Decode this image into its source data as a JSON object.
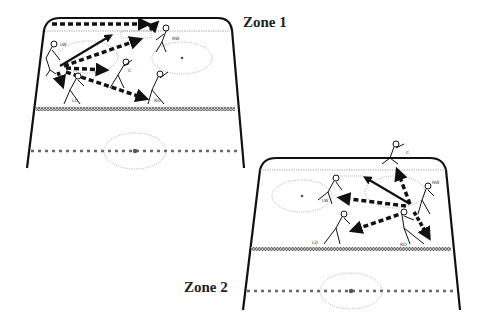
{
  "zones": [
    {
      "id": "zone1",
      "label": "Zone 1",
      "players": [
        {
          "id": "LW",
          "label": "LW"
        },
        {
          "id": "C",
          "label": "C"
        },
        {
          "id": "RW",
          "label": "RW"
        },
        {
          "id": "LD",
          "label": "LD"
        },
        {
          "id": "RD",
          "label": "RD"
        }
      ],
      "passes": [
        {
          "from": "LW",
          "to": "RW-boards",
          "style": "dashed"
        },
        {
          "from": "LW",
          "to": "blue-line-top",
          "style": "solid"
        },
        {
          "from": "LW",
          "to": "RW",
          "style": "dashed"
        },
        {
          "from": "LW",
          "to": "C",
          "style": "dashed"
        },
        {
          "from": "LW",
          "to": "RD",
          "style": "dashed"
        },
        {
          "from": "LW",
          "to": "LD",
          "style": "dashed"
        }
      ]
    },
    {
      "id": "zone2",
      "label": "Zone 2",
      "players": [
        {
          "id": "C",
          "label": "C"
        },
        {
          "id": "RW",
          "label": "RW"
        },
        {
          "id": "LW",
          "label": "LW"
        },
        {
          "id": "LD",
          "label": "LD"
        },
        {
          "id": "RD",
          "label": "RD"
        }
      ],
      "passes": [
        {
          "from": "RD",
          "to": "top-blue-line",
          "style": "solid"
        },
        {
          "from": "RD",
          "to": "C",
          "style": "dashed"
        },
        {
          "from": "RD",
          "to": "LW",
          "style": "dashed"
        },
        {
          "from": "RD",
          "to": "LD",
          "style": "dashed"
        },
        {
          "from": "RD",
          "to": "corner",
          "style": "dashed"
        }
      ]
    }
  ],
  "colors": {
    "ink": "#111111",
    "dotted": "#888888",
    "background": "#ffffff"
  }
}
